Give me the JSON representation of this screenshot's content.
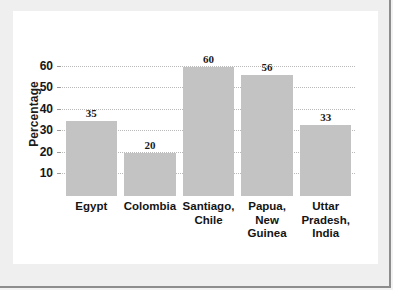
{
  "chart_data": {
    "type": "bar",
    "title": "",
    "subtitle": "",
    "xlabel": "",
    "ylabel": "Percentage",
    "ylim": [
      0,
      65
    ],
    "yticks": [
      10,
      20,
      30,
      40,
      50,
      60
    ],
    "ytick_labels": [
      "10",
      "20",
      "30",
      "40",
      "50",
      "60"
    ],
    "grid": "horizontal-dotted",
    "legend": "none",
    "bar_color": "#c3c3c3",
    "show_value_labels": true,
    "categories": [
      "Egypt",
      "Colombia",
      "Santiago, Chile",
      "Papua, New Guinea",
      "Uttar Pradesh, India"
    ],
    "category_label_lines": [
      [
        "Egypt"
      ],
      [
        "Colombia"
      ],
      [
        "Santiago,",
        "Chile"
      ],
      [
        "Papua,",
        "New",
        "Guinea"
      ],
      [
        "Uttar",
        "Pradesh,",
        "India"
      ]
    ],
    "values": [
      35,
      20,
      60,
      56,
      33
    ],
    "value_labels": [
      "35",
      "20",
      "60",
      "56",
      "33"
    ]
  },
  "colors": {
    "bar": "#c3c3c3",
    "gridline": "#b9b9b9",
    "text": "#161616",
    "card": "#ffffff",
    "page": "#efefef",
    "frame": "#8d8d8d"
  }
}
